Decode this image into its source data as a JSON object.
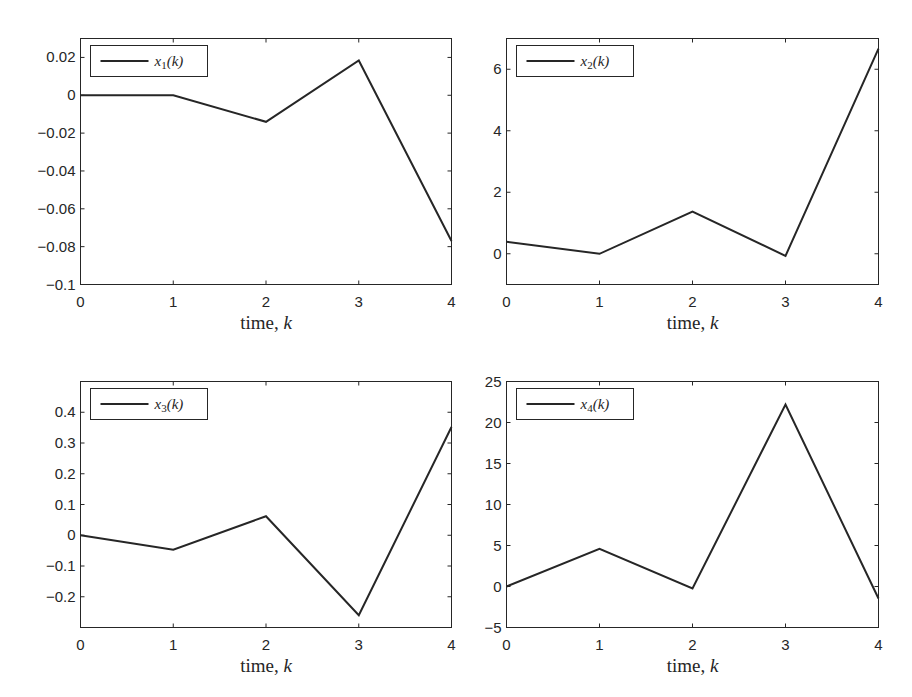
{
  "chart_data": [
    {
      "type": "line",
      "title": "",
      "xlabel": "time, k",
      "xlabel_parts": {
        "text": "time, ",
        "var": "k"
      },
      "ylabel": "",
      "legend": {
        "entries": [
          "x1(k)"
        ],
        "var": "x",
        "sub": "1",
        "arg": "(k)",
        "position": "top-left"
      },
      "x": [
        0,
        1,
        2,
        3,
        4
      ],
      "series": [
        {
          "name": "x1(k)",
          "values": [
            0,
            0,
            -0.014,
            0.0184,
            -0.077
          ]
        }
      ],
      "xlim": [
        0,
        4
      ],
      "ylim": [
        -0.1,
        0.03
      ],
      "xticks": [
        0,
        1,
        2,
        3,
        4
      ],
      "xtick_labels": [
        "0",
        "1",
        "2",
        "3",
        "4"
      ],
      "yticks": [
        -0.1,
        -0.08,
        -0.06,
        -0.04,
        -0.02,
        0,
        0.02
      ],
      "ytick_labels": [
        "−0.1",
        "−0.08",
        "−0.06",
        "−0.04",
        "−0.02",
        "0",
        "0.02"
      ],
      "grid": false,
      "line_color": "#262626"
    },
    {
      "type": "line",
      "title": "",
      "xlabel": "time, k",
      "xlabel_parts": {
        "text": "time, ",
        "var": "k"
      },
      "ylabel": "",
      "legend": {
        "entries": [
          "x2(k)"
        ],
        "var": "x",
        "sub": "2",
        "arg": "(k)",
        "position": "top-left"
      },
      "x": [
        0,
        1,
        2,
        3,
        4
      ],
      "series": [
        {
          "name": "x2(k)",
          "values": [
            0.39,
            0,
            1.37,
            -0.07,
            6.67
          ]
        }
      ],
      "xlim": [
        0,
        4
      ],
      "ylim": [
        -1,
        7
      ],
      "xticks": [
        0,
        1,
        2,
        3,
        4
      ],
      "xtick_labels": [
        "0",
        "1",
        "2",
        "3",
        "4"
      ],
      "yticks": [
        0,
        2,
        4,
        6
      ],
      "ytick_labels": [
        "0",
        "2",
        "4",
        "6"
      ],
      "grid": false,
      "line_color": "#262626"
    },
    {
      "type": "line",
      "title": "",
      "xlabel": "time, k",
      "xlabel_parts": {
        "text": "time, ",
        "var": "k"
      },
      "ylabel": "",
      "legend": {
        "entries": [
          "x3(k)"
        ],
        "var": "x",
        "sub": "3",
        "arg": "(k)",
        "position": "top-left"
      },
      "x": [
        0,
        1,
        2,
        3,
        4
      ],
      "series": [
        {
          "name": "x3(k)",
          "values": [
            0,
            -0.047,
            0.062,
            -0.26,
            0.352
          ]
        }
      ],
      "xlim": [
        0,
        4
      ],
      "ylim": [
        -0.3,
        0.5
      ],
      "xticks": [
        0,
        1,
        2,
        3,
        4
      ],
      "xtick_labels": [
        "0",
        "1",
        "2",
        "3",
        "4"
      ],
      "yticks": [
        -0.2,
        -0.1,
        0,
        0.1,
        0.2,
        0.3,
        0.4
      ],
      "ytick_labels": [
        "−0.2",
        "−0.1",
        "0",
        "0.1",
        "0.2",
        "0.3",
        "0.4"
      ],
      "grid": false,
      "line_color": "#262626"
    },
    {
      "type": "line",
      "title": "",
      "xlabel": "time, k",
      "xlabel_parts": {
        "text": "time, ",
        "var": "k"
      },
      "ylabel": "",
      "legend": {
        "entries": [
          "x4(k)"
        ],
        "var": "x",
        "sub": "4",
        "arg": "(k)",
        "position": "top-left"
      },
      "x": [
        0,
        1,
        2,
        3,
        4
      ],
      "series": [
        {
          "name": "x4(k)",
          "values": [
            0,
            4.58,
            -0.24,
            22.2,
            -1.46
          ]
        }
      ],
      "xlim": [
        0,
        4
      ],
      "ylim": [
        -5,
        25
      ],
      "xticks": [
        0,
        1,
        2,
        3,
        4
      ],
      "xtick_labels": [
        "0",
        "1",
        "2",
        "3",
        "4"
      ],
      "yticks": [
        -5,
        0,
        5,
        10,
        15,
        20,
        25
      ],
      "ytick_labels": [
        "−5",
        "0",
        "5",
        "10",
        "15",
        "20",
        "25"
      ],
      "grid": false,
      "line_color": "#262626"
    }
  ]
}
